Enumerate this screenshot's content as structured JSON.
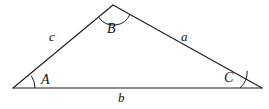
{
  "figure": {
    "name": "labeled-triangle",
    "background_color": "#ffffff",
    "stroke_color": "#1c1c1c",
    "text_color": "#111111"
  },
  "vertices": [
    {
      "id": "A",
      "label": "A",
      "x": 13,
      "y": 88,
      "angle_arc": true
    },
    {
      "id": "B",
      "label": "B",
      "x": 113,
      "y": 5,
      "angle_arc": true
    },
    {
      "id": "C",
      "label": "C",
      "x": 262,
      "y": 88,
      "angle_arc": true
    }
  ],
  "sides": [
    {
      "id": "a",
      "label": "a",
      "from": "B",
      "to": "C",
      "description": "right slanted side from apex B down to vertex C"
    },
    {
      "id": "b",
      "label": "b",
      "from": "A",
      "to": "C",
      "description": "horizontal base from vertex A to vertex C"
    },
    {
      "id": "c",
      "label": "c",
      "from": "A",
      "to": "B",
      "description": "left slanted side from vertex A up to apex B"
    }
  ],
  "geometry": {
    "path_points": "13,88 113,5 262,88 13,88",
    "base_y": 88,
    "apex_x": 113,
    "apex_y": 5,
    "left_x": 13,
    "right_x": 262
  },
  "arcs": {
    "A": {
      "path": "M 35,88 A 22,22 0 0 0 31.5,76.5",
      "radius": 22
    },
    "B": {
      "path": "M 98.8,17.2 A 18,18 0 0 0 129.7,13.8",
      "radius": 18
    },
    "C": {
      "path": "M 240,88 A 22,22 0 0 0 247.6,71.5",
      "radius": 22
    }
  }
}
